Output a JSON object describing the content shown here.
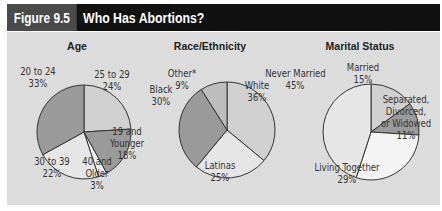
{
  "header": {
    "figure_number": "Figure 9.5",
    "title": "Who Has Abortions?"
  },
  "colors": {
    "header_bg": "#111111",
    "figure_number_bg": "#4a4a4a",
    "panel_bg": "#dcdcdc",
    "slice_dark": "#9a9a9a",
    "slice_mid": "#bdbdbd",
    "slice_light": "#d0d0d0",
    "slice_lighter": "#e6e6e6",
    "slice_white": "#f4f4f4"
  },
  "chart_data": [
    {
      "type": "pie",
      "title": "Age",
      "categories": [
        "25 to 29",
        "19 and Younger",
        "40 and Older",
        "30 to 39",
        "20 to 24"
      ],
      "values": [
        24,
        18,
        3,
        22,
        33
      ],
      "labels": [
        {
          "line1": "25 to 29",
          "line2": "24%"
        },
        {
          "line1": "19 and",
          "line2": "Younger",
          "line3": "18%"
        },
        {
          "line1": "40 and",
          "line2": "Older",
          "line3": "3%"
        },
        {
          "line1": "30 to 39",
          "line2": "22%"
        },
        {
          "line1": "20 to 24",
          "line2": "33%"
        }
      ]
    },
    {
      "type": "pie",
      "title": "Race/Ethnicity",
      "categories": [
        "White",
        "Latinas",
        "Black",
        "Other*"
      ],
      "values": [
        36,
        25,
        30,
        9
      ],
      "labels": [
        {
          "line1": "White",
          "line2": "36%"
        },
        {
          "line1": "Latinas",
          "line2": "25%"
        },
        {
          "line1": "Black",
          "line2": "30%"
        },
        {
          "line1": "Other*",
          "line2": "9%"
        }
      ]
    },
    {
      "type": "pie",
      "title": "Marital Status",
      "categories": [
        "Married",
        "Separated, Divorced, or Widowed",
        "Living Together",
        "Never Married"
      ],
      "values": [
        15,
        11,
        29,
        45
      ],
      "labels": [
        {
          "line1": "Married",
          "line2": "15%"
        },
        {
          "line1": "Separated,",
          "line2": "Divorced,",
          "line3": "or Widowed",
          "line4": "11%"
        },
        {
          "line1": "Living Together",
          "line2": "29%"
        },
        {
          "line1": "Never Married",
          "line2": "45%"
        }
      ]
    }
  ]
}
